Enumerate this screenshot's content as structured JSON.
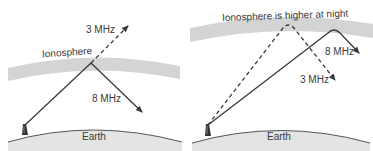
{
  "figure": {
    "panels": [
      {
        "id": "day",
        "ionosphere_label": "Ionosphere",
        "earth_label": "Earth",
        "rays": [
          {
            "frequency_label": "3 MHz",
            "style": "dashed",
            "behavior": "passes through ionosphere"
          },
          {
            "frequency_label": "8 MHz",
            "style": "solid",
            "behavior": "reflected back toward Earth"
          }
        ]
      },
      {
        "id": "night",
        "ionosphere_label": "Ionosphere is higher at night",
        "earth_label": "Earth",
        "rays": [
          {
            "frequency_label": "8 MHz",
            "style": "solid",
            "behavior": "reflected at higher altitude, lands farther"
          },
          {
            "frequency_label": "3 MHz",
            "style": "dashed",
            "behavior": "reflected back toward Earth"
          }
        ]
      }
    ],
    "colors": {
      "ionosphere": "#d4d4d4",
      "earth": "#e2e2e2",
      "ray": "#3a3a3a",
      "text": "#3a3a3a"
    }
  }
}
